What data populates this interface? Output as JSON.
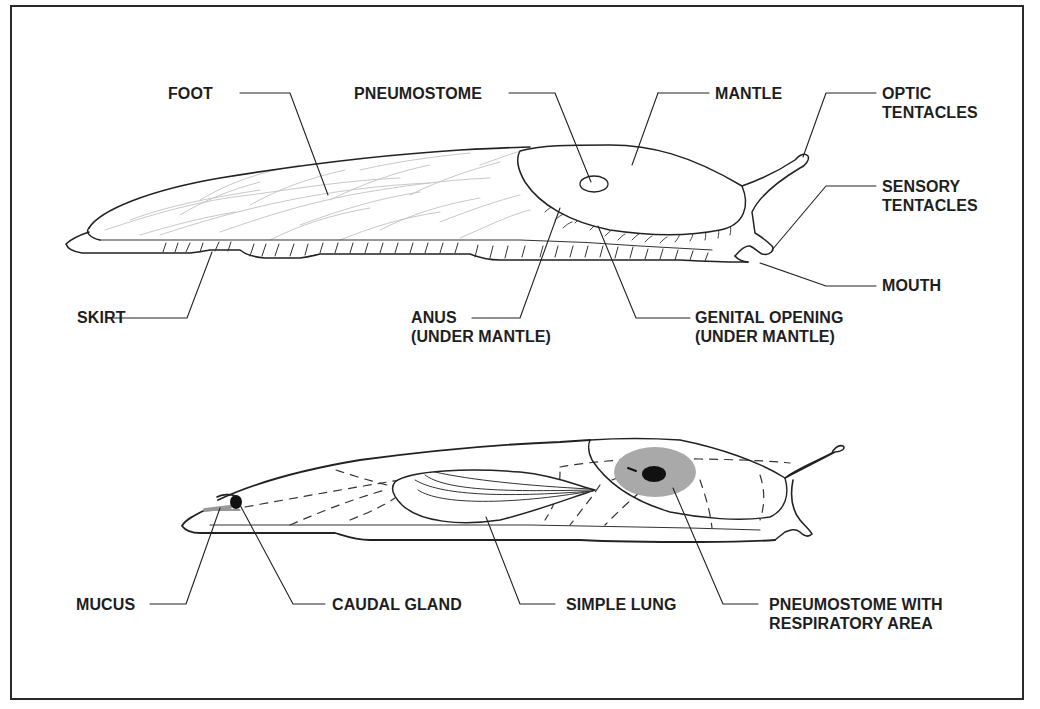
{
  "diagram": {
    "type": "anatomical-labeled-illustration",
    "top_figure": {
      "labels": {
        "foot": "FOOT",
        "pneumostome": "PNEUMOSTOME",
        "mantle": "MANTLE",
        "optic_tentacles": "OPTIC\nTENTACLES",
        "sensory_tentacles": "SENSORY\nTENTACLES",
        "mouth": "MOUTH",
        "skirt": "SKIRT",
        "anus": "ANUS\n(UNDER MANTLE)",
        "genital_opening": "GENITAL OPENING\n(UNDER MANTLE)"
      }
    },
    "bottom_figure": {
      "labels": {
        "mucus": "MUCUS",
        "caudal_gland": "CAUDAL GLAND",
        "simple_lung": "SIMPLE LUNG",
        "pneumostome_respiratory": "PNEUMOSTOME WITH\nRESPIRATORY AREA"
      }
    },
    "colors": {
      "line": "#1e1e1e",
      "texture": "#b8b8b8",
      "respiratory_area": "#a9a9a9",
      "pneumostome_dot": "#111111"
    }
  }
}
